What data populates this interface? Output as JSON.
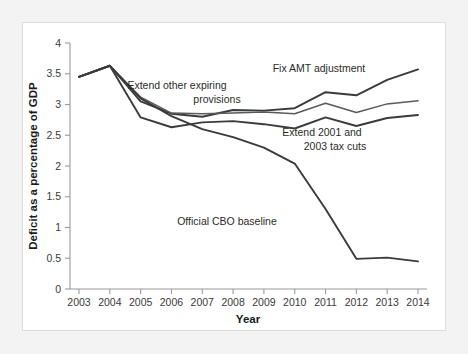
{
  "chart_data": {
    "type": "line",
    "title": "",
    "xlabel": "Year",
    "ylabel": "Deficit as a percentage of GDP",
    "categories": [
      2003,
      2004,
      2005,
      2006,
      2007,
      2008,
      2009,
      2010,
      2011,
      2012,
      2013,
      2014
    ],
    "x_tick_labels": [
      "2003",
      "2004",
      "2005",
      "2006",
      "2007",
      "2008",
      "2009",
      "2010",
      "2011",
      "2012",
      "2013",
      "2014"
    ],
    "y_tick_labels": [
      "0",
      "0.5",
      "1",
      "1.5",
      "2",
      "2.5",
      "3",
      "3.5",
      "4"
    ],
    "y_ticks": [
      0,
      0.5,
      1,
      1.5,
      2,
      2.5,
      3,
      3.5,
      4
    ],
    "ylim": [
      0,
      4
    ],
    "xlim": [
      2003,
      2014
    ],
    "grid": false,
    "legend_position": "inline-annotations",
    "line_color": "#3b3b3b",
    "series": [
      {
        "name": "Fix AMT adjustment",
        "values": [
          3.45,
          3.63,
          3.05,
          2.85,
          2.8,
          2.91,
          2.9,
          2.94,
          3.2,
          3.15,
          3.4,
          3.57
        ]
      },
      {
        "name": "Extend other expiring provisions",
        "values": [
          3.45,
          3.63,
          3.12,
          2.86,
          2.85,
          2.86,
          2.88,
          2.85,
          3.02,
          2.87,
          3.01,
          3.06
        ]
      },
      {
        "name": "Extend 2001 and 2003 tax cuts",
        "values": [
          3.45,
          3.63,
          2.79,
          2.63,
          2.71,
          2.73,
          2.68,
          2.61,
          2.79,
          2.65,
          2.78,
          2.83
        ]
      },
      {
        "name": "Official CBO baseline",
        "values": [
          3.45,
          3.63,
          3.1,
          2.81,
          2.6,
          2.47,
          2.3,
          2.04,
          1.3,
          0.49,
          0.51,
          0.45
        ]
      }
    ],
    "annotations": [
      {
        "text": "Fix AMT adjustment",
        "x": 320,
        "y": 71
      },
      {
        "text": "Extend other expiring",
        "x": 178,
        "y": 88
      },
      {
        "text": "provisions",
        "x": 218,
        "y": 102
      },
      {
        "text": "Extend 2001 and",
        "x": 323,
        "y": 135
      },
      {
        "text": "2003 tax cuts",
        "x": 336,
        "y": 149
      },
      {
        "text": "Official CBO baseline",
        "x": 228,
        "y": 224
      }
    ]
  }
}
